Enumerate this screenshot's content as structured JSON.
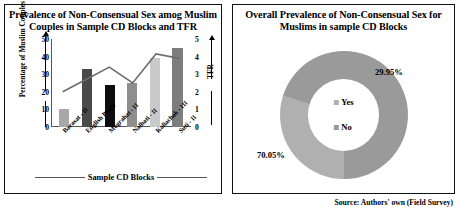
{
  "left_panel": {
    "title": "Prevalence of Non-Consensual Sex amog Muslim Couples in Sample CD Blocks and TFR",
    "y_left_title": "Percentage of Muslim Couples",
    "y_right_title": "TFR",
    "x_title": "Sample CD Blocks"
  },
  "right_panel": {
    "title": "Overall Prevalence of Non-Consensual Sex for Muslims in sample CD Blocks",
    "label_yes": "29.95%",
    "label_no": "70.05%",
    "legend": [
      {
        "label": "Yes",
        "color": "#b0b0b0"
      },
      {
        "label": "No",
        "color": "#9a9a9a"
      }
    ]
  },
  "source": "Source: Authors' own (Field Survey)",
  "chart_data": [
    {
      "type": "bar",
      "title": "Prevalence of Non-Consensual Sex amog Muslim Couples in Sample CD Blocks and TFR",
      "xlabel": "Sample CD Blocks",
      "ylabel": "Percentage of Muslim Couples",
      "y2label": "TFR",
      "ylim": [
        0,
        50
      ],
      "y2lim": [
        0,
        5
      ],
      "yticks": [
        0,
        10,
        20,
        30,
        40,
        50
      ],
      "y2ticks": [
        0,
        1,
        2,
        3,
        4,
        5
      ],
      "grid": false,
      "legend": "none",
      "categories": [
        "Barasat - II",
        "English Bazar",
        "Mograhat - II",
        "Nalhati - II",
        "Kaliachak - III",
        "Suti - II"
      ],
      "series": [
        {
          "name": "Percentage of Muslim Couples",
          "kind": "bar",
          "axis": "left",
          "values": [
            10,
            33,
            24,
            25,
            39,
            45
          ],
          "colors": [
            "#a8a8a8",
            "#4a4a4a",
            "#0d0d0d",
            "#8e8e8e",
            "#c9c9c9",
            "#7d7d7d"
          ]
        },
        {
          "name": "TFR",
          "kind": "line",
          "axis": "right",
          "values": [
            2.0,
            2.7,
            3.4,
            2.5,
            4.15,
            3.9
          ],
          "color": "#6e6e6e"
        }
      ]
    },
    {
      "type": "pie",
      "variant": "donut",
      "title": "Overall Prevalence of Non-Consensual Sex for Muslims in sample CD Blocks",
      "labels": [
        "Yes",
        "No"
      ],
      "values": [
        29.95,
        70.05
      ],
      "value_labels": [
        "29.95%",
        "70.05%"
      ],
      "colors": [
        "#b0b0b0",
        "#9a9a9a"
      ]
    }
  ]
}
